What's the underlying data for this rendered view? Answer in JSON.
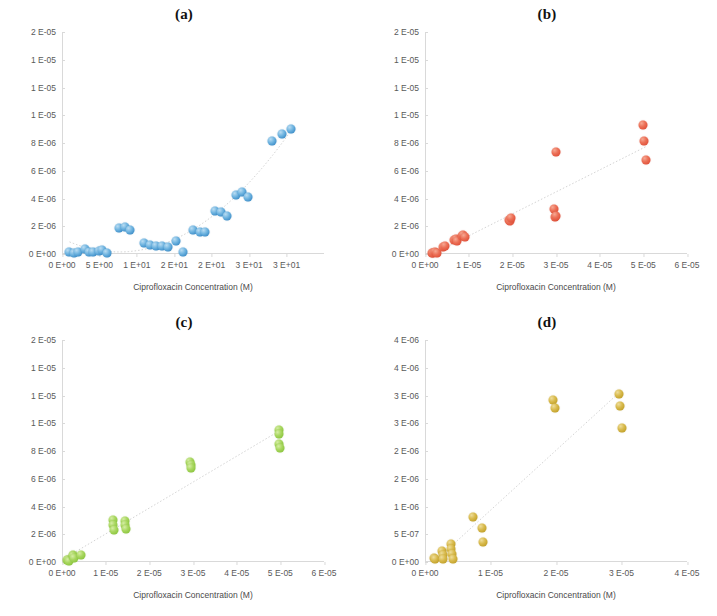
{
  "figure": {
    "axis_label_x": "Ciprofloxacin Concentration (M)",
    "axis_label_y": "Load (g Ciprofloxacin / g Polymer)"
  },
  "panels": [
    {
      "id": "a",
      "title": "(a)",
      "color": "#3f8fc9",
      "color_name": "blue",
      "marker_class": "blue"
    },
    {
      "id": "b",
      "title": "(b)",
      "color": "#e0513a",
      "color_name": "red",
      "marker_class": "red"
    },
    {
      "id": "c",
      "title": "(c)",
      "color": "#8cc63f",
      "color_name": "green",
      "marker_class": "green"
    },
    {
      "id": "d",
      "title": "(d)",
      "color": "#c2a12a",
      "color_name": "gold",
      "marker_class": "gold"
    }
  ],
  "chart_data": [
    {
      "type": "scatter",
      "panel": "a",
      "title": "(a)",
      "xlabel": "Ciprofloxacin Concentration (M)",
      "ylabel": "Load (g Ciprofloxacin / g Polymer)",
      "xlim": [
        0,
        35
      ],
      "ylim": [
        0,
        2e-05
      ],
      "xticks": [
        0,
        5,
        10,
        15,
        20,
        25,
        30,
        35
      ],
      "xticklabels": [
        "0 E+00",
        "5 E+00",
        "1 E+01",
        "2 E+01",
        "2 E+01",
        "3 E+01",
        "3 E+01"
      ],
      "yticks": [
        0,
        2.5e-06,
        5e-06,
        7.5e-06,
        1e-05,
        1.25e-05,
        1.5e-05,
        1.75e-05,
        2e-05
      ],
      "yticklabels": [
        "0 E+00",
        "2 E-06",
        "4 E-06",
        "6 E-06",
        "8 E-06",
        "1 E-05",
        "1 E-05",
        "1 E-05",
        "2 E-05"
      ],
      "grid": false,
      "legend": "none",
      "trendline": "polynomial",
      "series": [
        {
          "name": "Load",
          "color": "#3f8fc9",
          "points": [
            [
              1.0,
              1.5e-07
            ],
            [
              1.6,
              1e-07
            ],
            [
              2.2,
              2e-07
            ],
            [
              3.1,
              4.5e-07
            ],
            [
              3.6,
              2e-07
            ],
            [
              4.2,
              2e-07
            ],
            [
              4.9,
              3e-07
            ],
            [
              5.4,
              3.5e-07
            ],
            [
              6.0,
              1e-07
            ],
            [
              7.6,
              2.35e-06
            ],
            [
              8.4,
              2.45e-06
            ],
            [
              9.1,
              2.15e-06
            ],
            [
              11.0,
              1e-06
            ],
            [
              11.8,
              8e-07
            ],
            [
              12.6,
              7e-07
            ],
            [
              13.4,
              7.5e-07
            ],
            [
              14.2,
              6e-07
            ],
            [
              15.2,
              1.15e-06
            ],
            [
              16.2,
              1.5e-07
            ],
            [
              17.5,
              2.15e-06
            ],
            [
              18.4,
              1.95e-06
            ],
            [
              19.1,
              2e-06
            ],
            [
              20.4,
              3.9e-06
            ],
            [
              21.2,
              3.75e-06
            ],
            [
              22.0,
              3.4e-06
            ],
            [
              23.2,
              5.35e-06
            ],
            [
              24.1,
              5.55e-06
            ],
            [
              24.9,
              5.1e-06
            ],
            [
              28.0,
              1.02e-05
            ],
            [
              29.4,
              1.08e-05
            ],
            [
              30.6,
              1.13e-05
            ]
          ]
        }
      ]
    },
    {
      "type": "scatter",
      "panel": "b",
      "title": "(b)",
      "xlabel": "Ciprofloxacin Concentration (M)",
      "ylabel": "Load (g Ciprofloxacin / g Polymer)",
      "xlim": [
        0,
        6e-05
      ],
      "ylim": [
        0,
        2e-05
      ],
      "xticks": [
        0,
        1e-05,
        2e-05,
        3e-05,
        4e-05,
        5e-05,
        6e-05
      ],
      "xticklabels": [
        "0 E+00",
        "1 E-05",
        "2 E-05",
        "3 E-05",
        "4 E-05",
        "5 E-05",
        "6 E-05"
      ],
      "yticks": [
        0,
        2.5e-06,
        5e-06,
        7.5e-06,
        1e-05,
        1.25e-05,
        1.5e-05,
        1.75e-05,
        2e-05
      ],
      "yticklabels": [
        "0 E+00",
        "2 E-06",
        "4 E-06",
        "6 E-06",
        "8 E-06",
        "1 E-05",
        "1 E-05",
        "1 E-05",
        "2 E-05"
      ],
      "grid": false,
      "legend": "none",
      "trendline": "linear",
      "series": [
        {
          "name": "Load",
          "color": "#e0513a",
          "points": [
            [
              1.5e-06,
              1e-07
            ],
            [
              1.9e-06,
              1.2e-07
            ],
            [
              2.3e-06,
              1.5e-07
            ],
            [
              2.7e-06,
              1.3e-07
            ],
            [
              4.2e-06,
              6e-07
            ],
            [
              4.6e-06,
              7e-07
            ],
            [
              6.6e-06,
              1.25e-06
            ],
            [
              7e-06,
              1.35e-06
            ],
            [
              7.4e-06,
              1.2e-06
            ],
            [
              8.4e-06,
              1.6e-06
            ],
            [
              8.8e-06,
              1.7e-06
            ],
            [
              9.1e-06,
              1.55e-06
            ],
            [
              1.92e-05,
              3.1e-06
            ],
            [
              1.95e-05,
              2.95e-06
            ],
            [
              1.98e-05,
              3.25e-06
            ],
            [
              2.95e-05,
              4.05e-06
            ],
            [
              2.97e-05,
              3.35e-06
            ],
            [
              2.99e-05,
              3.45e-06
            ],
            [
              3e-05,
              9.2e-06
            ],
            [
              5e-05,
              1.16e-05
            ],
            [
              5.02e-05,
              1.02e-05
            ],
            [
              5.05e-05,
              8.5e-06
            ]
          ]
        }
      ]
    },
    {
      "type": "scatter",
      "panel": "c",
      "title": "(c)",
      "xlabel": "Ciprofloxacin Concentration (M)",
      "ylabel": "Load (g Ciprofloxacin / g Polymer)",
      "xlim": [
        0,
        6e-05
      ],
      "ylim": [
        0,
        2e-05
      ],
      "xticks": [
        0,
        1e-05,
        2e-05,
        3e-05,
        4e-05,
        5e-05,
        6e-05
      ],
      "xticklabels": [
        "0 E+00",
        "1 E-05",
        "2 E-05",
        "3 E-05",
        "4 E-05",
        "5 E-05",
        "6 E-05"
      ],
      "yticks": [
        0,
        2.5e-06,
        5e-06,
        7.5e-06,
        1e-05,
        1.25e-05,
        1.5e-05,
        1.75e-05,
        2e-05
      ],
      "yticklabels": [
        "0 E+00",
        "2 E-06",
        "4 E-06",
        "6 E-06",
        "8 E-06",
        "1 E-05",
        "1 E-05",
        "1 E-05",
        "2 E-05"
      ],
      "grid": false,
      "legend": "none",
      "trendline": "linear",
      "series": [
        {
          "name": "Load",
          "color": "#8cc63f",
          "points": [
            [
              1.1e-06,
              1.5e-07
            ],
            [
              1.4e-06,
              2e-07
            ],
            [
              1.6e-06,
              1e-07
            ],
            [
              2.5e-06,
              6.5e-07
            ],
            [
              2.6e-06,
              5e-07
            ],
            [
              2.8e-06,
              4e-07
            ],
            [
              4.3e-06,
              6e-07
            ],
            [
              1.16e-05,
              3.8e-06
            ],
            [
              1.17e-05,
              3.3e-06
            ],
            [
              1.18e-05,
              2.9e-06
            ],
            [
              1.44e-05,
              3.7e-06
            ],
            [
              1.45e-05,
              3.3e-06
            ],
            [
              1.47e-05,
              3e-06
            ],
            [
              2.93e-05,
              9.05e-06
            ],
            [
              2.95e-05,
              8.7e-06
            ],
            [
              2.96e-05,
              8.45e-06
            ],
            [
              4.96e-05,
              1.19e-05
            ],
            [
              4.97e-05,
              1.155e-05
            ],
            [
              4.98e-05,
              1.06e-05
            ],
            [
              4.99e-05,
              1.03e-05
            ]
          ]
        }
      ]
    },
    {
      "type": "scatter",
      "panel": "d",
      "title": "(d)",
      "xlabel": "Ciprofloxacin Concentration (M)",
      "ylabel": "Load (g Ciprofloxacin / g Polymer)",
      "xlim": [
        0,
        4e-05
      ],
      "ylim": [
        0,
        4e-06
      ],
      "xticks": [
        0,
        1e-05,
        2e-05,
        3e-05,
        4e-05
      ],
      "xticklabels": [
        "0 E+00",
        "1 E-05",
        "2 E-05",
        "3 E-05",
        "4 E-05"
      ],
      "yticks": [
        0,
        5e-07,
        1e-06,
        1.5e-06,
        2e-06,
        2.5e-06,
        3e-06,
        3.5e-06,
        4e-06
      ],
      "yticklabels": [
        "0 E+00",
        "5 E-07",
        "1 E-06",
        "2 E-06",
        "2 E-06",
        "3 E-06",
        "3 E-06",
        "4 E-06",
        "4 E-06"
      ],
      "grid": false,
      "legend": "none",
      "trendline": "linear",
      "series": [
        {
          "name": "Load",
          "color": "#c2a12a",
          "points": [
            [
              1.3e-06,
              8e-08
            ],
            [
              1.5e-06,
              6e-08
            ],
            [
              2.6e-06,
              2e-07
            ],
            [
              2.7e-06,
              1.2e-07
            ],
            [
              2.8e-06,
              5e-08
            ],
            [
              3.9e-06,
              3.3e-07
            ],
            [
              4e-06,
              2.3e-07
            ],
            [
              4.1e-06,
              1.4e-07
            ],
            [
              4.2e-06,
              6e-08
            ],
            [
              7.4e-06,
              8.2e-07
            ],
            [
              8.7e-06,
              6.1e-07
            ],
            [
              8.8e-06,
              3.6e-07
            ],
            [
              1.96e-05,
              2.92e-06
            ],
            [
              1.98e-05,
              2.78e-06
            ],
            [
              2.96e-05,
              3.02e-06
            ],
            [
              2.98e-05,
              2.82e-06
            ],
            [
              3e-05,
              2.42e-06
            ]
          ]
        }
      ]
    }
  ]
}
